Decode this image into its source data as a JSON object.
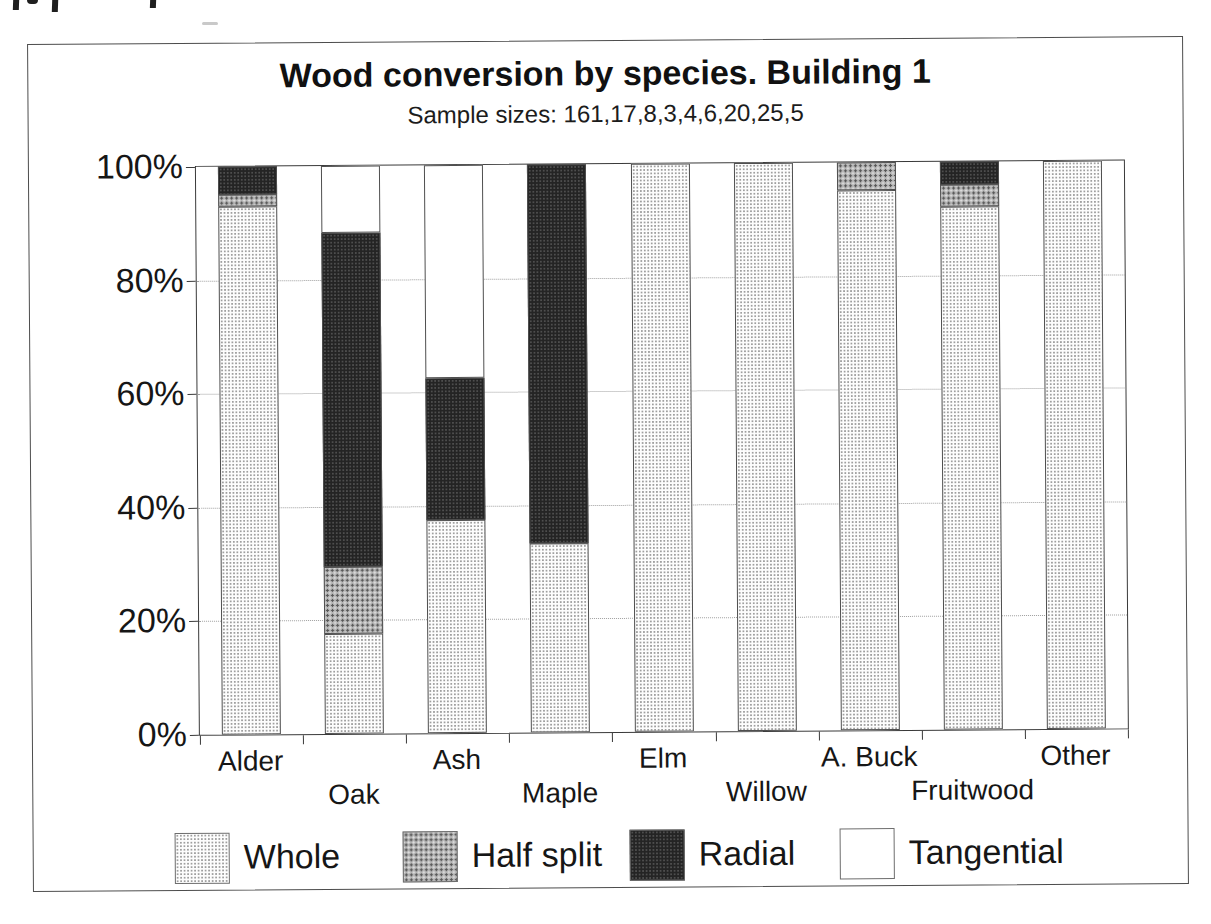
{
  "chart_data": {
    "type": "bar",
    "variant": "stacked-100-percent",
    "title": "Wood conversion by species. Building 1",
    "subtitle": "Sample sizes: 161,17,8,3,4,6,20,25,5",
    "categories": [
      "Alder",
      "Oak",
      "Ash",
      "Maple",
      "Elm",
      "Willow",
      "A. Buck",
      "Fruitwood",
      "Other"
    ],
    "sample_sizes": [
      161,
      17,
      8,
      3,
      4,
      6,
      20,
      25,
      5
    ],
    "series": [
      {
        "name": "Whole",
        "fill": "light-stipple",
        "values": [
          93,
          17.6,
          37.5,
          33.3,
          100,
          100,
          95,
          92,
          100
        ]
      },
      {
        "name": "Half split",
        "fill": "gray-stipple",
        "values": [
          2,
          11.8,
          0,
          0,
          0,
          0,
          5,
          4,
          0
        ]
      },
      {
        "name": "Radial",
        "fill": "dark-stipple",
        "values": [
          5,
          58.8,
          25,
          66.7,
          0,
          0,
          0,
          4,
          0
        ]
      },
      {
        "name": "Tangential",
        "fill": "white",
        "values": [
          0,
          11.8,
          37.5,
          0,
          0,
          0,
          0,
          0,
          0
        ]
      }
    ],
    "y_ticks": [
      "100%",
      "80%",
      "60%",
      "40%",
      "20%",
      "0%"
    ],
    "ylim": [
      0,
      100
    ],
    "grid": "horizontal-dotted",
    "legend_position": "bottom",
    "legend_entries": [
      "Whole",
      "Half split",
      "Radial",
      "Tangential"
    ]
  },
  "colors": {
    "ink": "#1a1a1a",
    "frame_border": "#4d4d4d",
    "gridline": "#9e9e9e",
    "fill_whole_base": "#fdfdfd",
    "fill_half_base": "#b2b2b2",
    "fill_radial_base": "#242424",
    "fill_tangential": "#ffffff"
  }
}
